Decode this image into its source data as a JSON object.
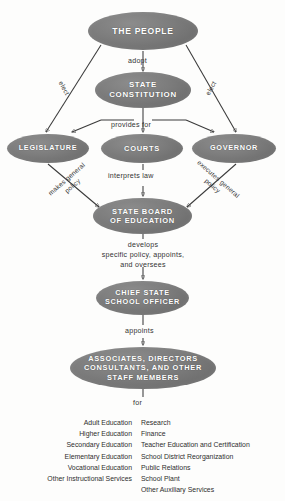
{
  "figure": {
    "kind": "organization-flow-chart",
    "node_fill_color": "#6e6e6e",
    "node_text_color": "#ffffff",
    "line_color": "#3a3a3a",
    "background_color": "#ffffff"
  },
  "nodes": {
    "people": "THE  PEOPLE",
    "constitution": "STATE\nCONSTITUTION",
    "constitution_line1": "STATE",
    "constitution_line2": "CONSTITUTION",
    "legislature": "LEGISLATURE",
    "courts": "COURTS",
    "governor": "GOVERNOR",
    "state_board_line1": "STATE  BOARD",
    "state_board_line2": "OF  EDUCATION",
    "chief_officer_line1": "CHIEF  STATE",
    "chief_officer_line2": "SCHOOL  OFFICER",
    "staff_line1": "ASSOCIATES,  DIRECTORS",
    "staff_line2": "CONSULTANTS,  AND  OTHER",
    "staff_line3": "STAFF  MEMBERS"
  },
  "edge_labels": {
    "adopt": "adopt",
    "elect_left": "elect",
    "elect_right": "elect",
    "provides_for": "provides  for",
    "interprets_law": "interprets  law",
    "makes_general_policy_line1": "makes general",
    "makes_general_policy_line2": "policy",
    "executes_general_policy_line1": "executes  general",
    "executes_general_policy_line2": "policy",
    "develops_line1": "develops",
    "develops_line2": "specific policy, appoints,",
    "develops_line3": "and oversees",
    "appoints": "appoints",
    "for": "for"
  },
  "function_lists": {
    "left_column": [
      "Adult Education",
      "Higher Education",
      "Secondary Education",
      "Elementary  Education",
      "Vocational Education",
      "Other Instructional Services"
    ],
    "right_column": [
      "Research",
      "Finance",
      "Teacher Education and Certification",
      "School District Reorganization",
      "Public Relations",
      "School Plant",
      "Other Auxiliary Services"
    ]
  },
  "chart_data": {
    "type": "diagram",
    "nodes": [
      {
        "id": "people",
        "label": "THE PEOPLE",
        "level": 0
      },
      {
        "id": "constitution",
        "label": "STATE CONSTITUTION",
        "level": 1
      },
      {
        "id": "legislature",
        "label": "LEGISLATURE",
        "level": 2
      },
      {
        "id": "courts",
        "label": "COURTS",
        "level": 2
      },
      {
        "id": "governor",
        "label": "GOVERNOR",
        "level": 2
      },
      {
        "id": "state_board",
        "label": "STATE BOARD OF EDUCATION",
        "level": 3
      },
      {
        "id": "chief",
        "label": "CHIEF STATE SCHOOL OFFICER",
        "level": 4
      },
      {
        "id": "staff",
        "label": "ASSOCIATES, DIRECTORS CONSULTANTS, AND OTHER STAFF MEMBERS",
        "level": 5
      }
    ],
    "edges": [
      {
        "from": "people",
        "to": "constitution",
        "label": "adopt"
      },
      {
        "from": "people",
        "to": "legislature",
        "label": "elect"
      },
      {
        "from": "people",
        "to": "governor",
        "label": "elect"
      },
      {
        "from": "constitution",
        "to": "legislature",
        "label": "provides for"
      },
      {
        "from": "constitution",
        "to": "courts",
        "label": "provides for"
      },
      {
        "from": "constitution",
        "to": "governor",
        "label": "provides for"
      },
      {
        "from": "legislature",
        "to": "state_board",
        "label": "makes general policy"
      },
      {
        "from": "courts",
        "to": "state_board",
        "label": "interprets law"
      },
      {
        "from": "governor",
        "to": "state_board",
        "label": "executes general policy"
      },
      {
        "from": "state_board",
        "to": "chief",
        "label": "develops specific policy, appoints, and oversees"
      },
      {
        "from": "chief",
        "to": "staff",
        "label": "appoints"
      }
    ]
  }
}
